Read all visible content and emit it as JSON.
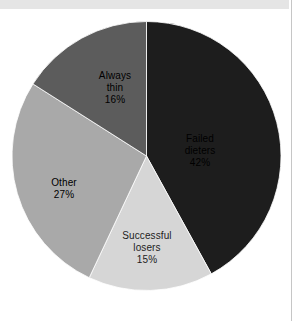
{
  "page": {
    "background_color": "#ffffff",
    "top_band_color": "#e5e5e5",
    "right_rule_color": "#c6c6c6"
  },
  "chart_data": {
    "type": "pie",
    "title": "",
    "subtitle": "",
    "xlabel": "",
    "ylabel": "",
    "legend_position": "none",
    "grid": false,
    "start_angle_deg": 0,
    "direction": "clockwise",
    "categories": [
      "Failed dieters",
      "Successful losers",
      "Other",
      "Always thin"
    ],
    "values": [
      42,
      15,
      27,
      16
    ],
    "value_unit": "%",
    "colors": [
      "#1d1d1d",
      "#d6d6d6",
      "#a9a9a9",
      "#5c5c5c"
    ],
    "slices": [
      {
        "name": "Failed dieters",
        "label_line1": "Failed",
        "label_line2": "dieters",
        "value": 42,
        "value_text": "42%",
        "color": "#1d1d1d",
        "label_color": "#ffffff",
        "start_deg": 0,
        "end_deg": 151.2
      },
      {
        "name": "Successful losers",
        "label_line1": "Successful",
        "label_line2": "losers",
        "value": 15,
        "value_text": "15%",
        "color": "#d6d6d6",
        "label_color": "#1d1d1d",
        "start_deg": 151.2,
        "end_deg": 205.2
      },
      {
        "name": "Other",
        "label_line1": "Other",
        "label_line2": "",
        "value": 27,
        "value_text": "27%",
        "color": "#a9a9a9",
        "label_color": "#ffffff",
        "start_deg": 205.2,
        "end_deg": 302.4
      },
      {
        "name": "Always thin",
        "label_line1": "Always",
        "label_line2": "thin",
        "value": 16,
        "value_text": "16%",
        "color": "#5c5c5c",
        "label_color": "#ffffff",
        "start_deg": 302.4,
        "end_deg": 360
      }
    ]
  }
}
